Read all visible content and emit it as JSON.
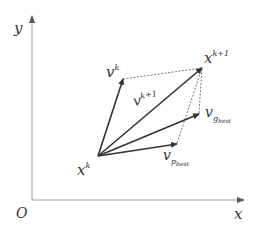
{
  "diagram": {
    "type": "vector-diagram",
    "colors": {
      "axis": "#9a9a9a",
      "vector": "#333333",
      "dashed": "#555555",
      "text": "#333333",
      "background": "#ffffff"
    },
    "axes": {
      "origin_label": "O",
      "x_label": "x",
      "y_label": "y"
    },
    "points": {
      "xk": {
        "label_base": "x",
        "label_sup": "k"
      },
      "xk1": {
        "label_base": "x",
        "label_sup": "k+1"
      }
    },
    "vectors": {
      "vk": {
        "label_base": "v",
        "label_sup": "k"
      },
      "vk1": {
        "label_base": "v",
        "label_sup": "k+1"
      },
      "vgbest": {
        "label_base": "v",
        "label_sub": "g",
        "label_subsub": "best"
      },
      "vpbest": {
        "label_base": "v",
        "label_sub": "p",
        "label_subsub": "best"
      }
    }
  }
}
